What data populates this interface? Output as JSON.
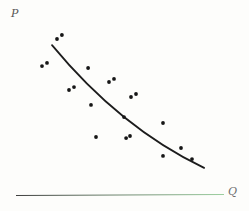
{
  "figure": {
    "y_axis_label": "P",
    "x_axis_label": "Q"
  },
  "chart_data": {
    "type": "scatter",
    "title": "",
    "xlabel": "Q",
    "ylabel": "P",
    "axes": {
      "numeric_ticks": false,
      "x_range_normalized": [
        0,
        1
      ],
      "y_range_normalized": [
        0,
        1
      ],
      "grid": false,
      "legend": "none"
    },
    "points": [
      [
        0.195,
        0.902
      ],
      [
        0.219,
        0.925
      ],
      [
        0.123,
        0.746
      ],
      [
        0.147,
        0.764
      ],
      [
        0.345,
        0.735
      ],
      [
        0.253,
        0.608
      ],
      [
        0.277,
        0.625
      ],
      [
        0.446,
        0.654
      ],
      [
        0.47,
        0.672
      ],
      [
        0.552,
        0.568
      ],
      [
        0.576,
        0.585
      ],
      [
        0.359,
        0.522
      ],
      [
        0.383,
        0.337
      ],
      [
        0.518,
        0.452
      ],
      [
        0.528,
        0.331
      ],
      [
        0.547,
        0.343
      ],
      [
        0.706,
        0.418
      ],
      [
        0.706,
        0.228
      ],
      [
        0.793,
        0.274
      ],
      [
        0.846,
        0.21
      ]
    ],
    "trend_curve": {
      "shape": "convex-decreasing",
      "start": [
        0.171,
        0.867
      ],
      "control": [
        0.499,
        0.392
      ],
      "end": [
        0.904,
        0.159
      ]
    },
    "colors": {
      "point": "#161616",
      "curve": "#1c1c1c",
      "y_axis_top": "#8f8f8f",
      "y_axis_bottom": "#555555",
      "x_axis_left": "#3f3f3f",
      "x_axis_right": "#9ccf9f",
      "p_label": "#555555",
      "q_label": "#6e6e6e",
      "background": "#fdfdfb"
    }
  }
}
